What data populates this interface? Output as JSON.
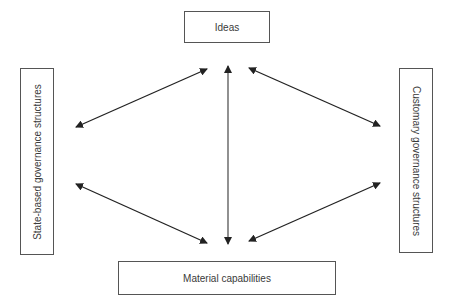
{
  "diagram": {
    "nodes": {
      "top": {
        "label": "Ideas"
      },
      "left": {
        "label": "State-based governance structures"
      },
      "right": {
        "label": "Customary governance structures"
      },
      "bottom": {
        "label": "Material capabilities"
      }
    },
    "edges": [
      {
        "from": "Ideas",
        "to": "State-based governance structures",
        "type": "bidirectional"
      },
      {
        "from": "Ideas",
        "to": "Customary governance structures",
        "type": "bidirectional"
      },
      {
        "from": "Ideas",
        "to": "Material capabilities",
        "type": "bidirectional"
      },
      {
        "from": "State-based governance structures",
        "to": "Material capabilities",
        "type": "bidirectional"
      },
      {
        "from": "Customary governance structures",
        "to": "Material capabilities",
        "type": "bidirectional"
      }
    ],
    "colors": {
      "border": "#555555",
      "arrow": "#222222",
      "vertical_arrow": "#555555",
      "text": "#3a3a3a"
    }
  }
}
